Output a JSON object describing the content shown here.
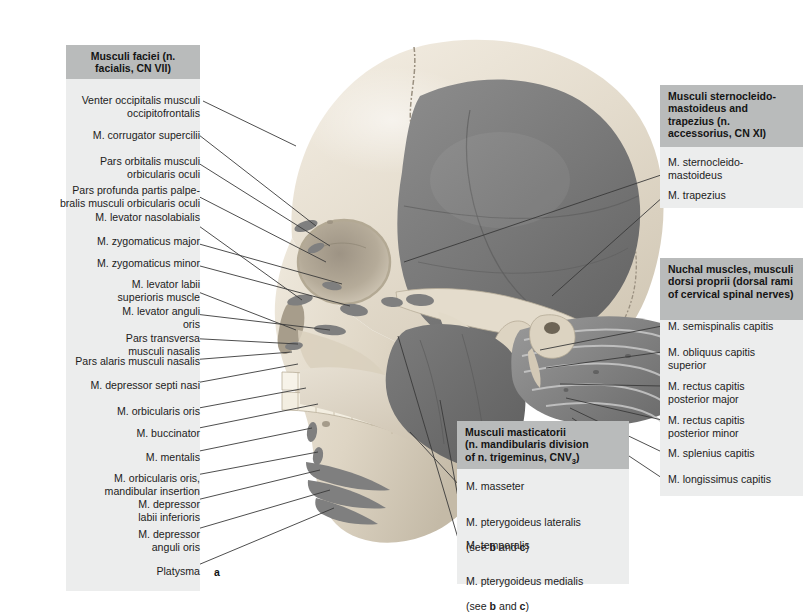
{
  "figure": {
    "panel_letter": "a",
    "colors": {
      "header_bg": "#b9bbbb",
      "panel_bg": "#eceded",
      "leader_line": "#3a3a3a",
      "bone_light": "#e9e3d8",
      "bone_mid": "#cdc4b4",
      "muscle_dark": "#6e6e6e",
      "muscle_mid": "#8d8d8d",
      "background": "#ffffff"
    }
  },
  "left_panel": {
    "header": "Musculi faciei\n(n. facialis, CN VII)",
    "items": [
      "Venter occipitalis musculi\noccipitofrontalis",
      "M. corrugator supercilii",
      "Pars orbitalis musculi\norbicularis oculi",
      "Pars profunda partis palpe-\nbralis musculi orbicularis oculi",
      "M. levator nasolabialis",
      "M. zygomaticus major",
      "M. zygomaticus minor",
      "M. levator labii\nsuperioris muscle",
      "M. levator anguli\noris",
      "Pars transversa\nmusculi nasalis",
      "Pars alaris musculi nasalis",
      "M. depressor septi nasi",
      "M. orbicularis oris",
      "M. buccinator",
      "M. mentalis",
      "M. orbicularis oris,\nmandibular insertion",
      "M. depressor\nlabii inferioris",
      "M. depressor\nanguli oris",
      "Platysma"
    ]
  },
  "right_panel_top": {
    "header": "Musculi sternocleido-\nmastoideus and\ntrapezius (n. accessorius,\nCN XI)",
    "items": [
      "M. sternocleido-\nmastoideus",
      "M. trapezius"
    ]
  },
  "right_panel_bottom": {
    "header": "Nuchal muscles,\nmusculi dorsi proprii\n(dorsal rami of\ncervical spinal nerves)",
    "items": [
      "M. semispinalis capitis",
      "M. obliquus capitis\nsuperior",
      "M. rectus capitis\nposterior major",
      "M. rectus capitis\nposterior minor",
      "M. splenius capitis",
      "M. longissimus capitis"
    ]
  },
  "center_panel": {
    "header_line1": "Musculi masticatorii",
    "header_line2": "(n. mandibularis division",
    "header_line3_a": "of n. trigeminus, CNV",
    "header_line3_sub": "3",
    "header_line3_b": ")",
    "items": [
      {
        "text": "M. masseter",
        "note": ""
      },
      {
        "text": "M. pterygoideus lateralis",
        "note": "(see b and c)"
      },
      {
        "text": "M. temporalis",
        "note": ""
      },
      {
        "text": "M. pterygoideus medialis",
        "note": "(see b and c)"
      }
    ]
  }
}
